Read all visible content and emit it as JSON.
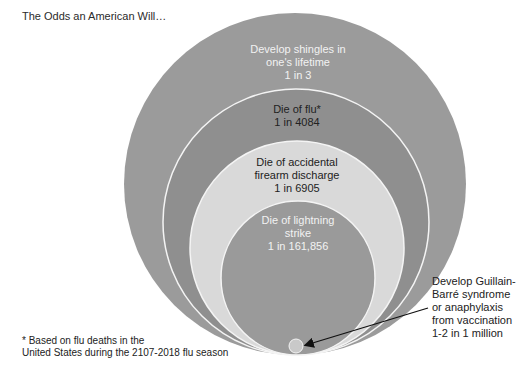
{
  "title": "The Odds an American Will…",
  "colors": {
    "outer": "#9b9b9b",
    "flu": "#8f8f8f",
    "firearm": "#d9d9d9",
    "lightning": "#9a9a9a",
    "vaccine": "#c9c9c9",
    "border": "#f4f4f4",
    "arrow": "#111111"
  },
  "circles": [
    {
      "id": "shingles",
      "lines": [
        "Develop shingles in",
        "one's lifetime",
        "1 in 3"
      ],
      "odds": "1 in 3"
    },
    {
      "id": "flu",
      "lines": [
        "Die of flu*",
        "1 in 4084"
      ],
      "odds": "1 in 4084"
    },
    {
      "id": "firearm",
      "lines": [
        "Die of accidental",
        "firearm discharge",
        "1 in 6905"
      ],
      "odds": "1 in 6905"
    },
    {
      "id": "lightning",
      "lines": [
        "Die of lightning",
        "strike",
        "1 in 161,856"
      ],
      "odds": "1 in 161,856"
    }
  ],
  "callout": {
    "lines": [
      "Develop Guillain-",
      "Barré syndrome",
      "or anaphylaxis",
      "from vaccination",
      "1-2 in 1 million"
    ],
    "odds": "1-2 in 1 million"
  },
  "footnote": {
    "lines": [
      "* Based on flu deaths in the",
      "United States during the 2107-2018 flu season"
    ]
  }
}
